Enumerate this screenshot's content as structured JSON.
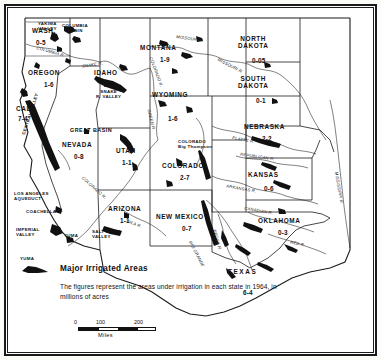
{
  "map": {
    "title": "Major Irrigated Areas",
    "subtitle": "The figures represent the areas under irrigation in each state in 1964, in millions of acres",
    "legend_swatch_label": "YUMA",
    "scale": {
      "ticks": [
        "0",
        "100",
        "200"
      ],
      "unit": "Miles"
    },
    "states": [
      {
        "name": "WASH.",
        "value": "0-5",
        "x": 46,
        "y": 34
      },
      {
        "name": "OREGON",
        "value": "1-6",
        "x": 49,
        "y": 74
      },
      {
        "name": "CAL.",
        "value": "7-4",
        "x": 25,
        "y": 112
      },
      {
        "name": "IDAHO",
        "value": "2-8",
        "x": 109,
        "y": 74
      },
      {
        "name": "MONTANA",
        "value": "1-9",
        "x": 164,
        "y": 50
      },
      {
        "name": "NORTH\nDAKOTA",
        "value": "0-05",
        "x": 257,
        "y": 48
      },
      {
        "name": "SOUTH\nDAKOTA",
        "value": "0-1",
        "x": 257,
        "y": 88
      },
      {
        "name": "WYOMING",
        "value": "1-6",
        "x": 173,
        "y": 97
      },
      {
        "name": "NEBRASKA",
        "value": "2-2",
        "x": 265,
        "y": 128
      },
      {
        "name": "NEVADA",
        "value": "0-8",
        "x": 76,
        "y": 146
      },
      {
        "name": "UTAH",
        "value": "1-1",
        "x": 128,
        "y": 152
      },
      {
        "name": "COLORADO",
        "value": "2-7",
        "x": 186,
        "y": 167
      },
      {
        "name": "KANSAS",
        "value": "0-6",
        "x": 268,
        "y": 176
      },
      {
        "name": "ARIZONA",
        "value": "1-1",
        "x": 124,
        "y": 211
      },
      {
        "name": "NEW MEXICO",
        "value": "0-7",
        "x": 186,
        "y": 219
      },
      {
        "name": "OKLAHOMA",
        "value": "0-3",
        "x": 283,
        "y": 222
      },
      {
        "name": "TEXAS",
        "value": "6-4",
        "x": 247,
        "y": 273
      }
    ],
    "regions": [
      {
        "label": "GREAT BASIN",
        "x": 95,
        "y": 131
      },
      {
        "label": "COLORADO\nBig Thompson",
        "x": 199,
        "y": 145
      },
      {
        "label": "SNAKE\nR. VALLEY",
        "x": 108,
        "y": 96
      },
      {
        "label": "CENTRAL VALLEY",
        "x": 47,
        "y": 140
      },
      {
        "label": "YAKIMA\nVALLEY",
        "x": 53,
        "y": 28
      },
      {
        "label": "COLUMBIA\nBASIN",
        "x": 74,
        "y": 30
      },
      {
        "label": "LOS ANGELES\nAQUEDUCT",
        "x": 38,
        "y": 196
      },
      {
        "label": "COACHELLA V.",
        "x": 48,
        "y": 212
      },
      {
        "label": "IMPERIAL\nVALLEY",
        "x": 40,
        "y": 232
      },
      {
        "label": "YUMA",
        "x": 74,
        "y": 235
      },
      {
        "label": "SALT RIVER\nVALLEY",
        "x": 110,
        "y": 235
      }
    ],
    "rivers": [
      {
        "label": "COLUMBIA R.",
        "x": 60,
        "y": 52
      },
      {
        "label": "MISSOURI R.",
        "x": 196,
        "y": 40
      },
      {
        "label": "MISSOURI R.",
        "x": 236,
        "y": 68
      },
      {
        "label": "SNAKE R.",
        "x": 96,
        "y": 66
      },
      {
        "label": "GREEN R.",
        "x": 150,
        "y": 122
      },
      {
        "label": "COLORADO R.",
        "x": 160,
        "y": 74
      },
      {
        "label": "PLATTE R.",
        "x": 249,
        "y": 141
      },
      {
        "label": "REPUBLICAN R.",
        "x": 262,
        "y": 158
      },
      {
        "label": "ARKANSAS R.",
        "x": 246,
        "y": 190
      },
      {
        "label": "COLORADO R.",
        "x": 96,
        "y": 190
      },
      {
        "label": "GILA R.",
        "x": 136,
        "y": 226
      },
      {
        "label": "RIO GRANDE",
        "x": 196,
        "y": 255
      },
      {
        "label": "PECOS R.",
        "x": 215,
        "y": 240
      },
      {
        "label": "RED R.",
        "x": 300,
        "y": 244
      },
      {
        "label": "CANADIAN R.",
        "x": 262,
        "y": 212
      },
      {
        "label": "MISSISSIPPI R.",
        "x": 337,
        "y": 190
      }
    ]
  }
}
